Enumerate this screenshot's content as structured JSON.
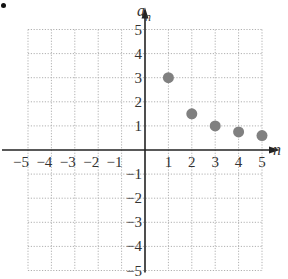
{
  "chart_data": {
    "type": "scatter",
    "title": "",
    "xlabel": "n",
    "ylabel": "a_n",
    "ylabel_main": "a",
    "ylabel_sub": "n",
    "xlim": [
      -5,
      5
    ],
    "ylim": [
      -5,
      5
    ],
    "grid": true,
    "grid_style": "dotted",
    "x_ticks": [
      -5,
      -4,
      -3,
      -2,
      -1,
      1,
      2,
      3,
      4,
      5
    ],
    "y_ticks": [
      -5,
      -4,
      -3,
      -2,
      -1,
      1,
      2,
      3,
      4,
      5
    ],
    "x_tick_labels": [
      "−5",
      "−4",
      "−3",
      "−2",
      "−1",
      "1",
      "2",
      "3",
      "4",
      "5"
    ],
    "y_tick_labels": [
      "−5",
      "−4",
      "−3",
      "−2",
      "−1",
      "1",
      "2",
      "3",
      "4",
      "5"
    ],
    "series": [
      {
        "name": "a_n",
        "x": [
          1,
          2,
          3,
          4,
          5
        ],
        "y": [
          3,
          1.5,
          1,
          0.75,
          0.6
        ],
        "color": "#808080"
      }
    ],
    "legend": null
  },
  "colors": {
    "axis": "#222222",
    "grid": "#b0b0b0",
    "point": "#808080"
  }
}
